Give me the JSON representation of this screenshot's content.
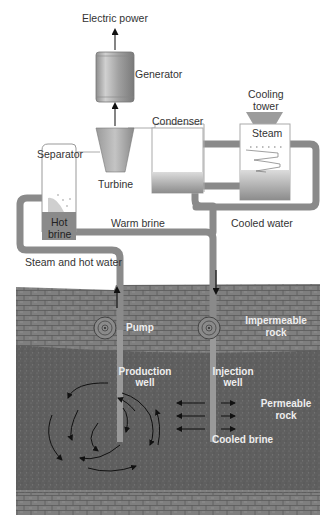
{
  "diagram": {
    "labels": {
      "electric_power": "Electric power",
      "generator": "Generator",
      "condenser": "Condenser",
      "cooling_tower_line1": "Cooling",
      "cooling_tower_line2": "tower",
      "steam": "Steam",
      "separator": "Separator",
      "turbine": "Turbine",
      "hot_brine_line1": "Hot",
      "hot_brine_line2": "brine",
      "warm_brine": "Warm brine",
      "cooled_water": "Cooled water",
      "steam_and_hot_water": "Steam and hot water",
      "pump": "Pump",
      "impermeable_rock_line1": "Impermeable",
      "impermeable_rock_line2": "rock",
      "production_well_line1": "Production",
      "production_well_line2": "well",
      "injection_well_line1": "Injection",
      "injection_well_line2": "well",
      "permeable_rock_line1": "Permeable",
      "permeable_rock_line2": "rock",
      "cooled_brine": "Cooled brine"
    },
    "colors": {
      "pipe": "#8a8a8a",
      "impermeable_rock": "#7d7d7d",
      "permeable_rock": "#5e5e5e",
      "component_fill": "#a9a9a9",
      "arrow": "#111111"
    }
  }
}
